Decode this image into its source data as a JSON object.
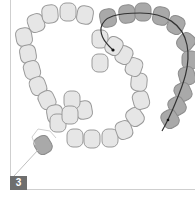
{
  "diagram": {
    "step_number": "3",
    "colors": {
      "light_bead_fill": "#e6e6e6",
      "light_bead_stroke": "#9a9a9a",
      "dark_bead_fill": "#a9a9a9",
      "dark_bead_stroke": "#8c8c8c",
      "thread": "#333333",
      "frame": "#cfcfcf",
      "badge": "#6e6e6e"
    },
    "light_beads": [
      {
        "cx": 36,
        "cy": 23,
        "r": -20
      },
      {
        "cx": 50,
        "cy": 14,
        "r": -5
      },
      {
        "cx": 68,
        "cy": 12,
        "r": 0
      },
      {
        "cx": 85,
        "cy": 15,
        "r": 10
      },
      {
        "cx": 100,
        "cy": 39,
        "r": 0
      },
      {
        "cx": 24,
        "cy": 37,
        "r": -10
      },
      {
        "cx": 28,
        "cy": 54,
        "r": -10
      },
      {
        "cx": 32,
        "cy": 70,
        "r": -15
      },
      {
        "cx": 38,
        "cy": 86,
        "r": -20
      },
      {
        "cx": 47,
        "cy": 100,
        "r": -25
      },
      {
        "cx": 55,
        "cy": 114,
        "r": -10
      },
      {
        "cx": 58,
        "cy": 123,
        "r": 0
      },
      {
        "cx": 75,
        "cy": 138,
        "r": 0
      },
      {
        "cx": 92,
        "cy": 139,
        "r": 0
      },
      {
        "cx": 110,
        "cy": 138,
        "r": 0
      },
      {
        "cx": 124,
        "cy": 130,
        "r": -20
      },
      {
        "cx": 135,
        "cy": 117,
        "r": -35
      },
      {
        "cx": 141,
        "cy": 100,
        "r": -15
      },
      {
        "cx": 139,
        "cy": 82,
        "r": 5
      },
      {
        "cx": 134,
        "cy": 67,
        "r": 20
      },
      {
        "cx": 124,
        "cy": 55,
        "r": 25
      },
      {
        "cx": 114,
        "cy": 46,
        "r": 30
      },
      {
        "cx": 100,
        "cy": 63,
        "r": 0
      },
      {
        "cx": 84,
        "cy": 110,
        "r": -10
      },
      {
        "cx": 72,
        "cy": 100,
        "r": 0
      },
      {
        "cx": 70,
        "cy": 115,
        "r": 0
      }
    ],
    "dark_beads": [
      {
        "cx": 108,
        "cy": 18,
        "r": -10
      },
      {
        "cx": 127,
        "cy": 14,
        "r": -5
      },
      {
        "cx": 143,
        "cy": 12,
        "r": 0
      },
      {
        "cx": 161,
        "cy": 16,
        "r": 10
      },
      {
        "cx": 176,
        "cy": 25,
        "r": 25
      },
      {
        "cx": 186,
        "cy": 42,
        "r": 40
      },
      {
        "cx": 190,
        "cy": 60,
        "r": 0
      },
      {
        "cx": 187,
        "cy": 76,
        "r": -15
      },
      {
        "cx": 183,
        "cy": 92,
        "r": -25
      },
      {
        "cx": 177,
        "cy": 106,
        "r": -30
      },
      {
        "cx": 170,
        "cy": 119,
        "r": -30
      },
      {
        "cx": 43,
        "cy": 145,
        "r": -30
      }
    ],
    "thread_path": "M 113 50 C 108 45, 100 38, 101 28 C 103 16, 118 13, 140 13 C 165 13, 183 24, 187 45 C 191 65, 183 85, 175 104 C 170 116, 166 124, 162 131",
    "thread_start": {
      "cx": 113,
      "cy": 50
    },
    "thread_end": {
      "cx": 168,
      "cy": 120
    },
    "highlight_outline": "M 35 145 L 32 137 L 38 129 L 50 131 L 56 138",
    "leader_line": {
      "x1": 14,
      "y1": 176,
      "x2": 38,
      "y2": 150
    }
  }
}
